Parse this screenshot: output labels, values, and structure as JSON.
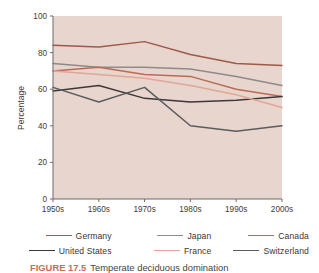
{
  "figure": {
    "caption_label": "FIGURE 17.5",
    "caption_text": "Temperate deciduous domination",
    "plot_bg_color": "#e8d5cd"
  },
  "axes": {
    "ylabel": "Percentage",
    "yticks": [
      "0",
      "20",
      "40",
      "60",
      "80",
      "100"
    ],
    "xticks": [
      "1950s",
      "1960s",
      "1970s",
      "1980s",
      "1990s",
      "2000s"
    ]
  },
  "legend": {
    "rows": [
      [
        {
          "label": "Germany",
          "color": "#9e5949"
        },
        {
          "label": "Japan",
          "color": "#8d8b8c"
        },
        {
          "label": "Canada",
          "color": "#bb6b55"
        }
      ],
      [
        {
          "label": "United States",
          "color": "#3d3838"
        },
        {
          "label": "France",
          "color": "#e0a795"
        },
        {
          "label": "Switzerland",
          "color": "#5a5c60"
        }
      ]
    ]
  },
  "chart_data": {
    "type": "line",
    "title": "",
    "xlabel": "",
    "ylabel": "Percentage",
    "categories": [
      "1950s",
      "1960s",
      "1970s",
      "1980s",
      "1990s",
      "2000s"
    ],
    "ylim": [
      0,
      100
    ],
    "xlim": [
      0,
      5
    ],
    "grid": false,
    "legend_position": "bottom",
    "series": [
      {
        "name": "Germany",
        "color": "#9e5949",
        "values": [
          84,
          83,
          86,
          79,
          74,
          73
        ]
      },
      {
        "name": "Japan",
        "color": "#8d8b8c",
        "values": [
          74,
          72,
          72,
          71,
          67,
          62
        ]
      },
      {
        "name": "Canada",
        "color": "#bb6b55",
        "values": [
          70,
          72,
          68,
          67,
          60,
          56
        ]
      },
      {
        "name": "United States",
        "color": "#3d3838",
        "values": [
          59,
          62,
          55,
          53,
          54,
          56
        ]
      },
      {
        "name": "France",
        "color": "#e0a795",
        "values": [
          70,
          68,
          66,
          62,
          57,
          50
        ]
      },
      {
        "name": "Switzerland",
        "color": "#5a5c60",
        "values": [
          61,
          53,
          61,
          40,
          37,
          40
        ]
      }
    ]
  }
}
